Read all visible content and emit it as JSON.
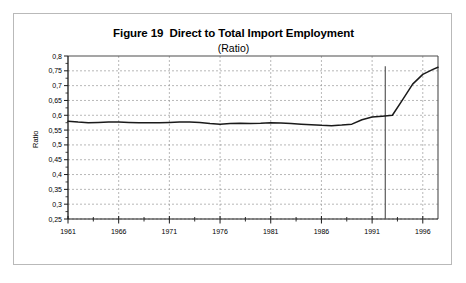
{
  "figure": {
    "title": "Figure 19  Direct to Total Import Employment",
    "subtitle": "(Ratio)"
  },
  "chart_data": {
    "type": "line",
    "title": "Figure 19  Direct to Total Import Employment",
    "subtitle": "(Ratio)",
    "xlabel": "",
    "ylabel": "Ratio",
    "xlim": [
      1961,
      1997.5
    ],
    "ylim": [
      0.25,
      0.8
    ],
    "grid": true,
    "legend": null,
    "y_tick_labels": [
      "0,8",
      "0,75",
      "0,7",
      "0,65",
      "0,6",
      "0,55",
      "0,5",
      "0,45",
      "0,4",
      "0,35",
      "0,3",
      "0,25"
    ],
    "y_tick_values": [
      0.8,
      0.75,
      0.7,
      0.65,
      0.6,
      0.55,
      0.5,
      0.45,
      0.4,
      0.35,
      0.3,
      0.25
    ],
    "x_tick_labels": [
      "1961",
      "1966",
      "1971",
      "1976",
      "1981",
      "1986",
      "1991",
      "1996"
    ],
    "x_tick_values": [
      1961,
      1966,
      1971,
      1976,
      1981,
      1986,
      1991,
      1996
    ],
    "x_minor_step": 2.5,
    "decimal_separator": ",",
    "line_color": "#1a1a1a",
    "grid_color": "#9a9a9a",
    "axis_color": "#4d4d4d",
    "marker_line": {
      "x": 1992.3,
      "y_top": 0.765,
      "y_bottom": 0.25,
      "color": "#5a5a5a"
    },
    "series": [
      {
        "name": "Direct to Total Import Employment",
        "x": [
          1961,
          1962,
          1963,
          1964,
          1965,
          1966,
          1967,
          1968,
          1969,
          1970,
          1971,
          1972,
          1973,
          1974,
          1975,
          1976,
          1977,
          1978,
          1979,
          1980,
          1981,
          1982,
          1983,
          1984,
          1985,
          1986,
          1987,
          1988,
          1989,
          1990,
          1991,
          1992,
          1993,
          1994,
          1995,
          1996,
          1997,
          1997.5
        ],
        "values": [
          0.58,
          0.577,
          0.575,
          0.576,
          0.577,
          0.577,
          0.576,
          0.575,
          0.575,
          0.575,
          0.576,
          0.577,
          0.577,
          0.576,
          0.572,
          0.57,
          0.572,
          0.573,
          0.572,
          0.573,
          0.575,
          0.574,
          0.572,
          0.57,
          0.568,
          0.566,
          0.565,
          0.567,
          0.57,
          0.585,
          0.594,
          0.597,
          0.6,
          0.652,
          0.705,
          0.738,
          0.755,
          0.762
        ]
      }
    ]
  }
}
